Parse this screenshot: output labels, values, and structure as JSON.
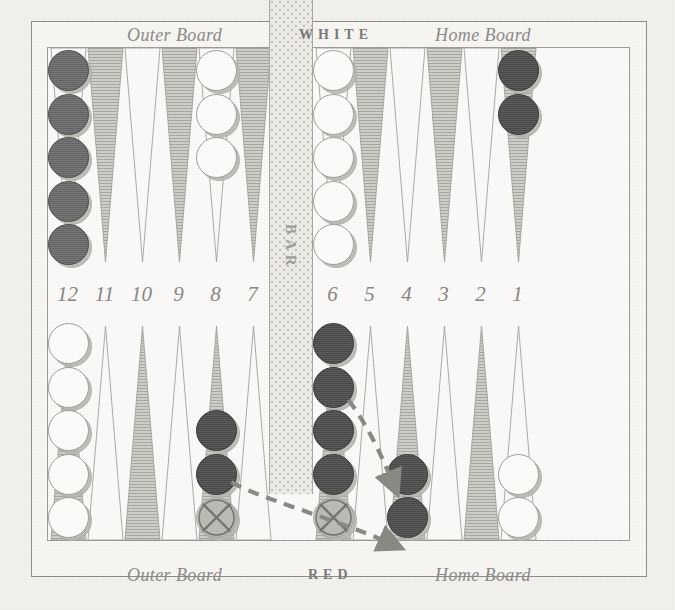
{
  "board": {
    "title_top_center": "WHITE",
    "title_bottom_center": "RED",
    "outer_board_label": "Outer Board",
    "home_board_label": "Home Board",
    "bar_label": "BAR",
    "point_numbers": [
      "12",
      "11",
      "10",
      "9",
      "8",
      "7",
      "6",
      "5",
      "4",
      "3",
      "2",
      "1"
    ],
    "colors": {
      "paper": "#f3f1ed",
      "board_surface": "#fbfaf8",
      "point_shaded": "#c9c8c2",
      "point_plain": "#fbfaf8",
      "frame": "#8d8d8a",
      "bar": "#ecebe6",
      "label_text": "#8b8a87",
      "checker_white": "#fcfcfa",
      "checker_red": "#6b6b6b",
      "checker_red_dark": "#4f4f4f",
      "checker_ghost": "#bdbcb7",
      "arrow": "#8a8984"
    },
    "top_half": {
      "description": "White's outer board (left, points 12-7) and White's home board (right, points 6-1)",
      "points": [
        {
          "number": "12",
          "shaded": false,
          "checkers": 5,
          "color": "red"
        },
        {
          "number": "11",
          "shaded": true,
          "checkers": 0,
          "color": ""
        },
        {
          "number": "10",
          "shaded": false,
          "checkers": 0,
          "color": ""
        },
        {
          "number": "9",
          "shaded": true,
          "checkers": 0,
          "color": ""
        },
        {
          "number": "8",
          "shaded": false,
          "checkers": 3,
          "color": "white"
        },
        {
          "number": "7",
          "shaded": true,
          "checkers": 0,
          "color": ""
        },
        {
          "number": "6",
          "shaded": false,
          "checkers": 5,
          "color": "white"
        },
        {
          "number": "5",
          "shaded": true,
          "checkers": 0,
          "color": ""
        },
        {
          "number": "4",
          "shaded": false,
          "checkers": 0,
          "color": ""
        },
        {
          "number": "3",
          "shaded": true,
          "checkers": 0,
          "color": ""
        },
        {
          "number": "2",
          "shaded": false,
          "checkers": 0,
          "color": ""
        },
        {
          "number": "1",
          "shaded": true,
          "checkers": 2,
          "color": "reddark"
        }
      ]
    },
    "bottom_half": {
      "description": "Red's outer board (left) and Red's home board (right)",
      "points": [
        {
          "number": "12",
          "shaded": true,
          "checkers": 5,
          "color": "white",
          "marked": 0
        },
        {
          "number": "11",
          "shaded": false,
          "checkers": 0,
          "color": "",
          "marked": 0
        },
        {
          "number": "10",
          "shaded": true,
          "checkers": 0,
          "color": "",
          "marked": 0
        },
        {
          "number": "9",
          "shaded": false,
          "checkers": 0,
          "color": "",
          "marked": 0
        },
        {
          "number": "8",
          "shaded": true,
          "checkers": 3,
          "color": "reddark",
          "marked": 1
        },
        {
          "number": "7",
          "shaded": false,
          "checkers": 0,
          "color": "",
          "marked": 0
        },
        {
          "number": "6",
          "shaded": true,
          "checkers": 5,
          "color": "reddark",
          "marked": 1
        },
        {
          "number": "5",
          "shaded": false,
          "checkers": 0,
          "color": "",
          "marked": 0
        },
        {
          "number": "4",
          "shaded": true,
          "checkers": 2,
          "color": "reddark",
          "marked": 0
        },
        {
          "number": "3",
          "shaded": false,
          "checkers": 0,
          "color": "",
          "marked": 0
        },
        {
          "number": "2",
          "shaded": true,
          "checkers": 0,
          "color": "",
          "marked": 0
        },
        {
          "number": "1",
          "shaded": false,
          "checkers": 2,
          "color": "white",
          "marked": 0
        }
      ]
    },
    "move_arrows": [
      {
        "name": "arrow-8-to-4",
        "from_point": "8",
        "to_point": "4",
        "style": "dashed"
      },
      {
        "name": "arrow-6-to-4",
        "from_point": "6",
        "to_point": "4",
        "style": "dashed"
      }
    ]
  }
}
